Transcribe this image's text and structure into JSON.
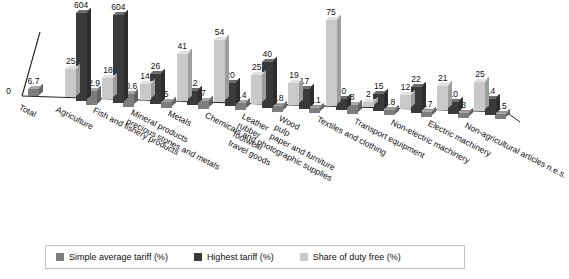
{
  "chart_data": {
    "type": "bar",
    "title": "",
    "xlabel": "",
    "ylabel": "",
    "grid": false,
    "legend_position": "bottom",
    "axis_origin_label": "0",
    "ylim": [
      0,
      604
    ],
    "categories": [
      "Total",
      "Agriculture",
      "Fish and fishery products",
      "Mineral products, precious stones and metals",
      "Metals",
      "Chemicals and photographic supplies",
      "Leather, rubber, footwear, travel goods",
      "Wood, pulp, paper and furniture",
      "Textiles and clothing",
      "Transport equipment",
      "Non-electric machinery",
      "Electric machinery",
      "Non-agricultural articles n.e.s."
    ],
    "series": [
      {
        "name": "Simple average tariff (%)",
        "color": "#7d7d7d",
        "values": [
          6.7,
          12.9,
          10.6,
          5,
          7,
          6.4,
          4.8,
          1.1,
          8,
          4.8,
          1.7,
          3,
          2.5
        ]
      },
      {
        "name": "Highest tariff (%)",
        "color": "#3a3a3a",
        "values": [
          null,
          604,
          604,
          26,
          12,
          20,
          40,
          17,
          10,
          15,
          22,
          10,
          14
        ]
      },
      {
        "name": "Share of duty free (%)",
        "color": "#c9c9c9",
        "values": [
          null,
          25,
          18,
          14,
          41,
          54,
          25,
          19,
          75,
          2,
          12,
          21,
          25
        ]
      }
    ]
  },
  "legend": {
    "items": [
      {
        "label": "Simple average tariff (%)"
      },
      {
        "label": "Highest tariff (%)"
      },
      {
        "label": "Share of duty free (%)"
      }
    ]
  }
}
